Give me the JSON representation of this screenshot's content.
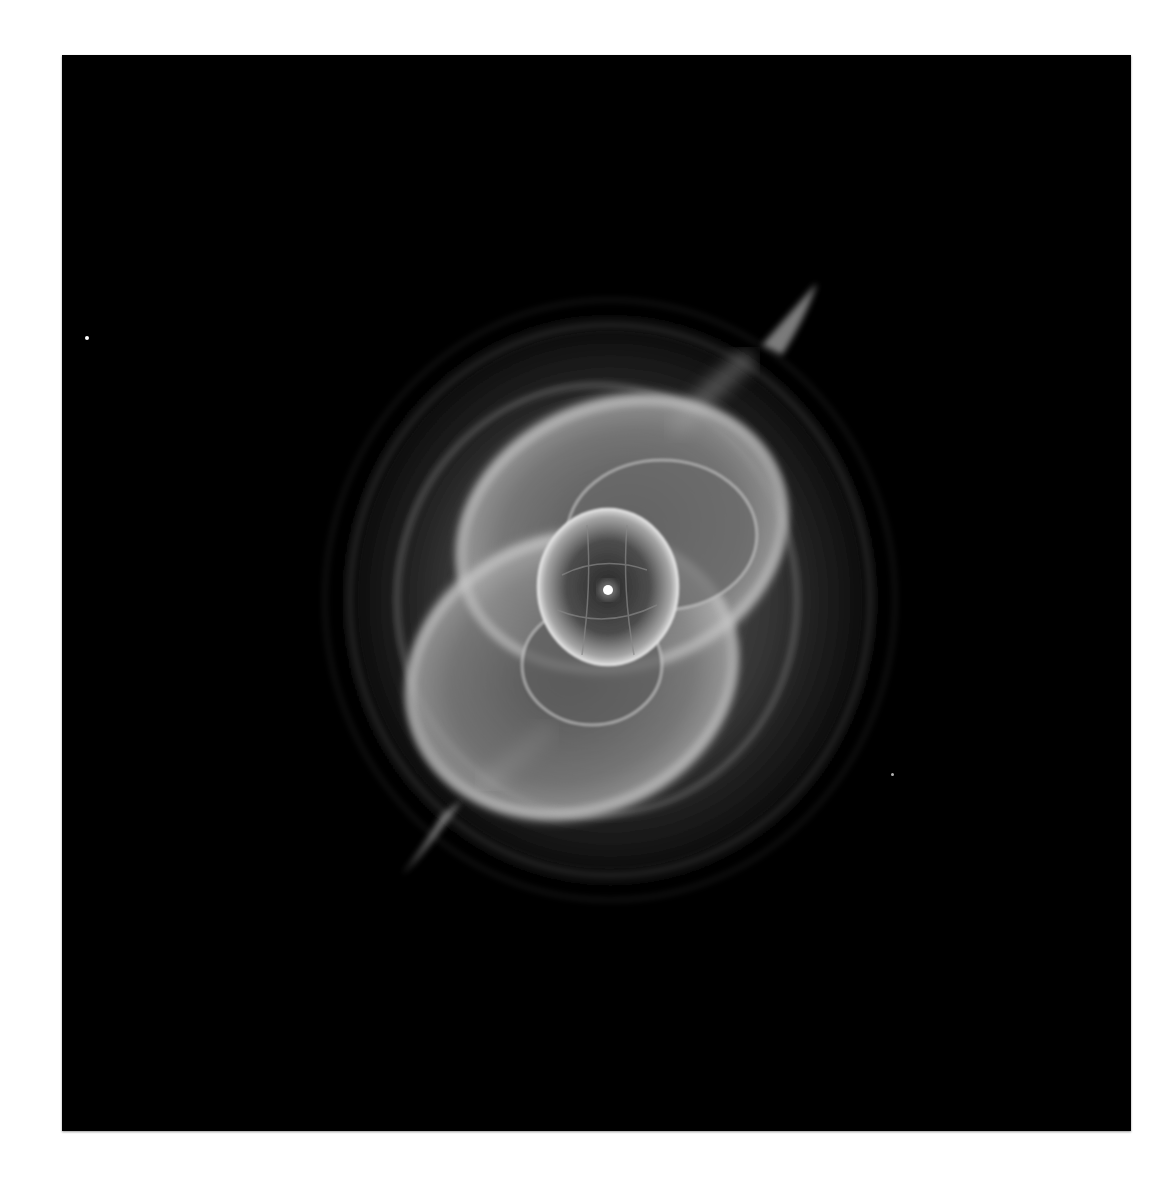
{
  "image": {
    "subject": "planetary nebula (Cat's Eye Nebula)",
    "style": "grayscale astronomical photograph",
    "background_color": "#000000",
    "page_color": "#ffffff",
    "frame": {
      "x": 62,
      "y": 55,
      "width": 1069,
      "height": 1076
    },
    "central_star": {
      "x": 608,
      "y": 590
    },
    "field_stars": [
      {
        "x": 85,
        "y": 338
      },
      {
        "x": 892,
        "y": 775
      },
      {
        "x": 400,
        "y": 870
      }
    ]
  }
}
